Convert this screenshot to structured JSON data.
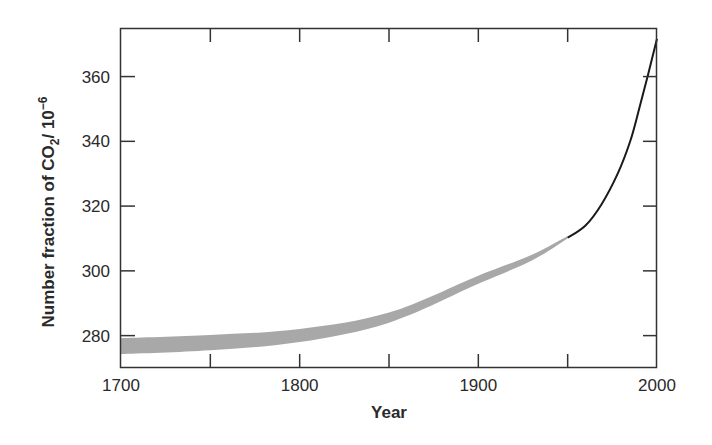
{
  "chart_data": {
    "type": "line",
    "title": "",
    "xlabel": "Year",
    "ylabel_parts": {
      "prefix": "Number fraction of CO",
      "subscript": "2",
      "middle": "/ 10",
      "superscript": "−6"
    },
    "ylabel": "Number fraction of CO2/ 10^-6",
    "xlim": [
      1700,
      2000
    ],
    "ylim": [
      270,
      375
    ],
    "x_ticks": [
      1700,
      1750,
      1800,
      1850,
      1900,
      1950,
      2000
    ],
    "x_tick_labels": [
      "1700",
      "1800",
      "1900",
      "2000"
    ],
    "y_ticks": [
      280,
      300,
      320,
      340,
      360
    ],
    "y_tick_labels": [
      "280",
      "300",
      "320",
      "340",
      "360"
    ],
    "grid": false,
    "legend": null,
    "series": [
      {
        "name": "Ice-core range (uncertainty band)",
        "style": "band",
        "color": "#a8a8a8",
        "x": [
          1700,
          1750,
          1800,
          1850,
          1900,
          1930,
          1950
        ],
        "upper": [
          279.2,
          280.2,
          282.0,
          287.1,
          298.5,
          305.0,
          310.8
        ],
        "lower": [
          274.3,
          275.5,
          278.0,
          284.0,
          296.0,
          303.2,
          310.0
        ]
      },
      {
        "name": "Direct atmospheric measurements",
        "style": "line",
        "color": "#1a1a1a",
        "x": [
          1950,
          1960,
          1969,
          1978,
          1985,
          1990,
          1995,
          2000
        ],
        "values": [
          310.2,
          314.0,
          320.6,
          330.0,
          340.0,
          350.0,
          360.6,
          371.7
        ]
      }
    ]
  }
}
